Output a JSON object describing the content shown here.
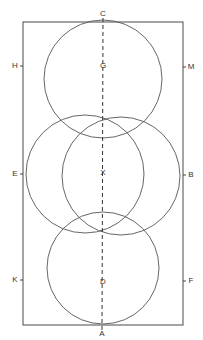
{
  "diagram": {
    "title": "",
    "colors": {
      "stroke": "#4a4a4a",
      "text": "#333333",
      "background": "#ffffff"
    },
    "frame": {
      "x": 23,
      "y": 22,
      "width": 160,
      "height": 303
    },
    "axis": {
      "x": 103,
      "y1": 17,
      "y2": 330,
      "style": "dashed"
    },
    "circles": [
      {
        "id": "top",
        "center_label": "G",
        "cx": 103,
        "cy": 79,
        "r": 59
      },
      {
        "id": "middle-left",
        "center_label": "",
        "cx": 85,
        "cy": 174,
        "r": 59
      },
      {
        "id": "middle-right",
        "center_label": "",
        "cx": 121,
        "cy": 176,
        "r": 59
      },
      {
        "id": "bottom",
        "center_label": "D",
        "cx": 103,
        "cy": 268,
        "r": 56
      }
    ],
    "labels": {
      "top": "C",
      "bottom": "A",
      "left_upper": "H",
      "right_upper": "M",
      "center_upper": "G",
      "left_middle": "E",
      "center_middle": "X",
      "right_middle": "B",
      "left_lower": "K",
      "center_lower": "D",
      "right_lower": "F"
    }
  }
}
